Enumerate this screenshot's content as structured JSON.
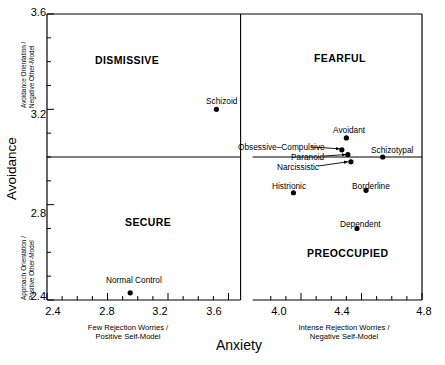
{
  "chart_data": {
    "type": "scatter",
    "title": "",
    "xlabel": "Anxiety",
    "ylabel": "Avoidance",
    "xlim": [
      2.4,
      4.8
    ],
    "ylim": [
      2.4,
      3.6
    ],
    "xticks": [
      "2.4",
      "2.8",
      "3.2",
      "3.6",
      "4.0",
      "4.4",
      "4.8"
    ],
    "yticks": [
      "3.6",
      "3.2",
      "2.8",
      "2.4"
    ],
    "grid": false,
    "legend": "none",
    "axis_break_x": 3.72,
    "divider_x": 3.68,
    "divider_y": 3.0,
    "x_axis_left_caption": "Few Rejection Worries /\nPositive Self-Model",
    "x_axis_left_caption_line1": "Few Rejection Worries /",
    "x_axis_left_caption_line2": "Positive Self-Model",
    "x_axis_right_caption_line1": "Intense Rejection Worries /",
    "x_axis_right_caption_line2": "Negative Self-Model",
    "y_axis_top_caption_line1": "Avoidance Orientation /",
    "y_axis_top_caption_line2": "Negative Other-Model",
    "y_axis_bottom_caption_line1": "Approach Orientation /",
    "y_axis_bottom_caption_line2": "Positive Other-Model",
    "quadrants": [
      {
        "name": "DISMISSIVE",
        "x": 3.02,
        "y": 3.44
      },
      {
        "name": "FEARFUL",
        "x": 4.3,
        "y": 3.45
      },
      {
        "name": "SECURE",
        "x": 3.06,
        "y": 2.74
      },
      {
        "name": "PREOCCUPIED",
        "x": 4.34,
        "y": 2.58
      }
    ],
    "points": [
      {
        "label": "Schizoid",
        "x": 3.52,
        "y": 3.2,
        "label_pos": "above"
      },
      {
        "label": "Avoidant",
        "x": 4.3,
        "y": 3.08,
        "label_pos": "above"
      },
      {
        "label": "Obsessive–Compulsive",
        "x": 4.27,
        "y": 3.03,
        "label_pos": "leader-left"
      },
      {
        "label": "Paranoid",
        "x": 4.31,
        "y": 3.01,
        "label_pos": "leader-left"
      },
      {
        "label": "Narcissistic",
        "x": 4.33,
        "y": 2.98,
        "label_pos": "leader-left"
      },
      {
        "label": "Schizotypal",
        "x": 4.54,
        "y": 3.0,
        "label_pos": "above"
      },
      {
        "label": "Histrionic",
        "x": 3.95,
        "y": 2.85,
        "label_pos": "above"
      },
      {
        "label": "Borderline",
        "x": 4.43,
        "y": 2.86,
        "label_pos": "above"
      },
      {
        "label": "Dependent",
        "x": 4.37,
        "y": 2.7,
        "label_pos": "above"
      },
      {
        "label": "Normal Control",
        "x": 2.95,
        "y": 2.43,
        "label_pos": "above"
      }
    ],
    "marker_color": "#000000",
    "axis_color": "#000000"
  }
}
